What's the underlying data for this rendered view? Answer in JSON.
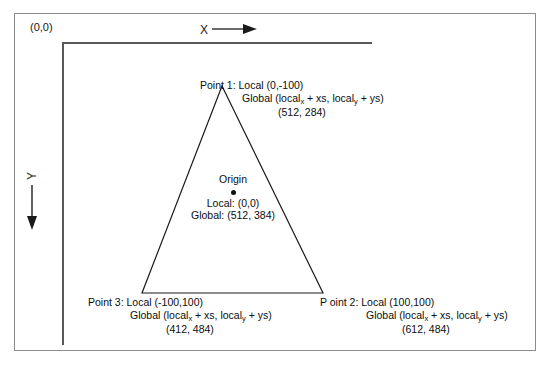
{
  "diagram": {
    "frame": {
      "border_color": "#8c8c8c"
    },
    "axes": {
      "origin_label": "(0,0)",
      "x_axis_letter": "X",
      "y_axis_letter": "Y",
      "x_arrow_icon": "arrow-right-icon",
      "y_arrow_icon": "arrow-down-icon",
      "line_color": "#58585a"
    },
    "shape": {
      "type": "triangle",
      "stroke_color": "#1a1a1a",
      "vertices": [
        {
          "name": "Point 1",
          "x": 222,
          "y": 86
        },
        {
          "name": "Point 2",
          "x": 323,
          "y": 293
        },
        {
          "name": "Point 3",
          "x": 142,
          "y": 293
        }
      ]
    },
    "origin_point": {
      "title": "Origin",
      "dot_icon": "filled-dot-icon",
      "local": "Local: (0,0)",
      "global": "Global: (512, 384)"
    },
    "labels": {
      "point1": {
        "line1": "Point 1: Local (0,-100)",
        "line2_prefix": "Global (local",
        "line2_sub1": "x",
        "line2_mid": " + xs, local",
        "line2_sub2": "y",
        "line2_suffix": " + ys)",
        "line3": "(512, 284)"
      },
      "point2": {
        "line1": "P oint 2: Local (100,100)",
        "line2_prefix": "Global (local",
        "line2_sub1": "x",
        "line2_mid": " + xs, local",
        "line2_sub2": "y",
        "line2_suffix": " + ys)",
        "line3": "(612, 484)"
      },
      "point3": {
        "line1": "Point 3: Local (-100,100)",
        "line2_prefix": "Global (local",
        "line2_sub1": "x",
        "line2_mid": " + xs, local",
        "line2_sub2": "y",
        "line2_suffix": " + ys)",
        "line3": "(412, 484)"
      }
    }
  }
}
